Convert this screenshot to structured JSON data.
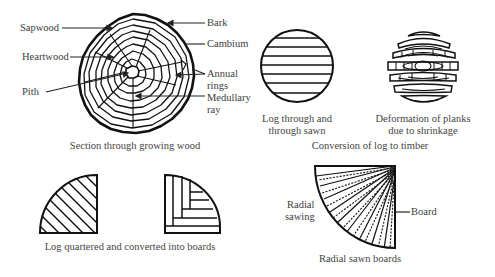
{
  "figures": {
    "growing_wood": {
      "caption": "Section through growing wood",
      "labels": {
        "sapwood": "Sapwood",
        "heartwood": "Heartwood",
        "pith": "Pith",
        "bark": "Bark",
        "cambium": "Cambium",
        "annual_rings_1": "Annual",
        "annual_rings_2": "rings",
        "medullary_ray_1": "Medullary",
        "medullary_ray_2": "ray"
      }
    },
    "through_sawn": {
      "caption_1": "Log through and",
      "caption_2": "through sawn"
    },
    "deformation": {
      "caption_1": "Deformation of planks",
      "caption_2": "due to shrinkage"
    },
    "conversion_group": {
      "caption": "Conversion of log to timber"
    },
    "quartered": {
      "caption": "Log quartered and converted into boards"
    },
    "radial": {
      "caption": "Radial sawn boards",
      "labels": {
        "radial_sawing_1": "Radial",
        "radial_sawing_2": "sawing",
        "board": "Board"
      }
    }
  },
  "colors": {
    "ink": "#111111",
    "text": "#3c3c3c",
    "background": "#ffffff"
  }
}
